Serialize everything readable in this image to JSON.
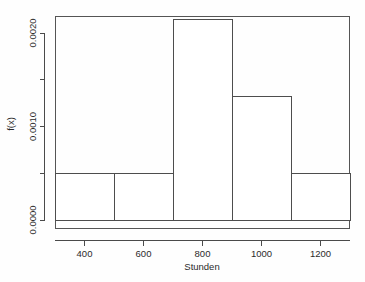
{
  "chart_data": {
    "type": "bar",
    "title": "",
    "subtitle": "",
    "xlabel": "Stunden",
    "ylabel": "f(x)",
    "xlim": [
      300,
      1300
    ],
    "ylim": [
      0.0,
      0.00225
    ],
    "grid": false,
    "legend": null,
    "bin_width": 200,
    "bin_edges": [
      300,
      500,
      700,
      900,
      1100,
      1300
    ],
    "categories": [
      "300-500",
      "500-700",
      "700-900",
      "900-1100",
      "1100-1300"
    ],
    "values": [
      0.0005,
      0.0005,
      0.00215,
      0.00133,
      0.0005
    ],
    "bars": [
      {
        "label": "300-500",
        "x0": 300,
        "x1": 500,
        "density": 0.0005
      },
      {
        "label": "500-700",
        "x0": 500,
        "x1": 700,
        "density": 0.0005
      },
      {
        "label": "700-900",
        "x0": 700,
        "x1": 900,
        "density": 0.00215
      },
      {
        "label": "900-1100",
        "x0": 900,
        "x1": 1100,
        "density": 0.00133
      },
      {
        "label": "1100-1300",
        "x0": 1100,
        "x1": 1300,
        "density": 0.0005
      }
    ],
    "x_ticks": [
      {
        "value": 400,
        "label": "400"
      },
      {
        "value": 600,
        "label": "600"
      },
      {
        "value": 800,
        "label": "800"
      },
      {
        "value": 1000,
        "label": "1000"
      },
      {
        "value": 1200,
        "label": "1200"
      }
    ],
    "y_ticks": [
      {
        "value": 0.0,
        "label": "0.0000",
        "labeled": true
      },
      {
        "value": 0.0005,
        "label": "",
        "labeled": false
      },
      {
        "value": 0.001,
        "label": "0.0010",
        "labeled": true
      },
      {
        "value": 0.0015,
        "label": "",
        "labeled": false
      },
      {
        "value": 0.002,
        "label": "0.0020",
        "labeled": true
      }
    ],
    "colors": {
      "bar_fill": "#ffffff",
      "bar_stroke": "#4d4d4d",
      "axis": "#4a4a4a",
      "frame": "#555555",
      "text": "#2b2b2b",
      "background": "#fefefe"
    }
  },
  "axes": {
    "x_title": "Stunden",
    "y_title": "f(x)"
  }
}
